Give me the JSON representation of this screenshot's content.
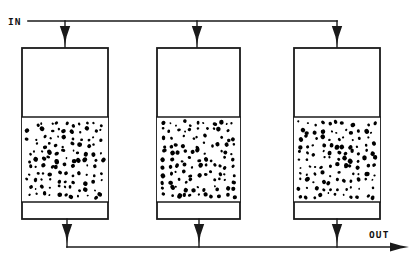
{
  "diagram": {
    "type": "process-flow-diagram",
    "canvas": {
      "width": 413,
      "height": 271,
      "background": "#ffffff"
    },
    "line_color": "#1a1a1a",
    "fill_color": "#ffffff",
    "particle_color": "#000000",
    "labels": {
      "inlet": "IN",
      "outlet": "OUT"
    },
    "inlet_header": {
      "y": 21,
      "x_start": 28,
      "x_end": 337,
      "label_x": 8,
      "label_y": 25
    },
    "outlet_header": {
      "y": 247,
      "x_start": 67,
      "x_end": 398,
      "arrow_tip_x": 404,
      "label_x": 369,
      "label_y": 238
    },
    "vessels": [
      {
        "name": "vessel-1",
        "x": 22,
        "width": 86,
        "top_y": 48,
        "bottom_y": 219,
        "bed_top_y": 117,
        "bed_bottom_y": 202,
        "feed_x": 65,
        "drain_x": 67
      },
      {
        "name": "vessel-2",
        "x": 157,
        "width": 83,
        "top_y": 48,
        "bottom_y": 219,
        "bed_top_y": 117,
        "bed_bottom_y": 202,
        "feed_x": 197,
        "drain_x": 199
      },
      {
        "name": "vessel-3",
        "x": 294,
        "width": 86,
        "top_y": 48,
        "bottom_y": 219,
        "bed_top_y": 117,
        "bed_bottom_y": 202,
        "feed_x": 337,
        "drain_x": 337
      }
    ],
    "bed_particles": {
      "description": "randomly scattered dark granules representing packed bed media",
      "count_per_vessel": 125,
      "min_radius": 1.0,
      "max_radius": 2.4
    }
  }
}
